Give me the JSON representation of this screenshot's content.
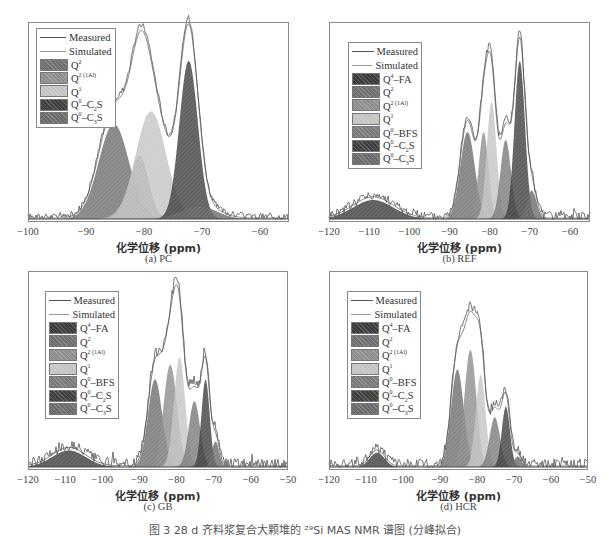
{
  "colors": {
    "measured": "#555555",
    "simulated": "#8a8a8a",
    "frame": "#8a8a8a",
    "Q4-FA": "#3a3a3a",
    "Q2": "#6e6e6e",
    "Q2(1Al)": "#8e8e8e",
    "Q1": "#c4c4c4",
    "Q0-BFS": "#7a7a7a",
    "Q0-C2S": "#3e3e3e",
    "Q0-C3S": "#6a6a6a"
  },
  "caption": "图 3  28 d 齐料浆复合大颗堆的 ²⁹Si MAS NMR 谱图 (分峰拟合)",
  "chart_data": [
    {
      "type": "area",
      "panel_label": "(a)  PC",
      "xlabel": "化学位移 (ppm)",
      "ylabel": "",
      "xlim": [
        -100,
        -55
      ],
      "x_ticks": [
        -100,
        -90,
        -80,
        -70,
        -60
      ],
      "grid": false,
      "legend_position": "upper-left",
      "legend": [
        "Measured",
        "Simulated",
        "Q2",
        "Q2 (1Al)",
        "Q1",
        "Q0-C2S",
        "Q0-C3S"
      ],
      "peaks": [
        {
          "name": "Q2",
          "center": -85.2,
          "height": 0.6,
          "width": 2.6
        },
        {
          "name": "Q2(1Al)",
          "center": -80.8,
          "height": 0.4,
          "width": 1.6
        },
        {
          "name": "Q1",
          "center": -78.8,
          "height": 0.68,
          "width": 2.6
        },
        {
          "name": "Q0-C2S",
          "center": -72.3,
          "height": 1.0,
          "width": 1.6
        },
        {
          "name": "Q0-C3S",
          "center": -70.5,
          "height": 0.08,
          "width": 3.0
        }
      ],
      "measured_peak_max": 1.18,
      "ylim": [
        0,
        1.22
      ],
      "noise_floor": 0.02
    },
    {
      "type": "area",
      "panel_label": "(b)  REF",
      "xlabel": "化学位移 (ppm)",
      "ylabel": "",
      "xlim": [
        -120,
        -55
      ],
      "x_ticks": [
        -120,
        -110,
        -100,
        -90,
        -80,
        -70,
        -60
      ],
      "grid": false,
      "legend_position": "upper-left",
      "legend": [
        "Measured",
        "Simulated",
        "Q4-FA",
        "Q2",
        "Q2 (1Al)",
        "Q1",
        "Q0-BFS",
        "Q0-C2S",
        "Q0-C3S"
      ],
      "peaks": [
        {
          "name": "Q4-FA",
          "center": -109,
          "height": 0.12,
          "width": 5.0
        },
        {
          "name": "Q2",
          "center": -85.5,
          "height": 0.55,
          "width": 1.8
        },
        {
          "name": "Q2(1Al)",
          "center": -81.5,
          "height": 0.55,
          "width": 1.2
        },
        {
          "name": "Q1",
          "center": -79.5,
          "height": 0.74,
          "width": 1.2
        },
        {
          "name": "Q0-BFS",
          "center": -76,
          "height": 0.5,
          "width": 1.3
        },
        {
          "name": "Q0-C2S",
          "center": -72.5,
          "height": 1.0,
          "width": 1.3
        },
        {
          "name": "Q0-C3S",
          "center": -69.5,
          "height": 0.18,
          "width": 1.2
        }
      ],
      "ylim": [
        0,
        1.22
      ],
      "noise_floor": 0.03
    },
    {
      "type": "area",
      "panel_label": "(c)  GB",
      "xlabel": "化学位移 (ppm)",
      "ylabel": "",
      "xlim": [
        -120,
        -50
      ],
      "x_ticks": [
        -120,
        -110,
        -100,
        -90,
        -80,
        -70,
        -60,
        -50
      ],
      "grid": false,
      "legend_position": "upper-left",
      "legend": [
        "Measured",
        "Simulated",
        "Q4-FA",
        "Q2",
        "Q2 (1Al)",
        "Q1",
        "Q0-BFS",
        "Q0-C2S",
        "Q0-C3S"
      ],
      "peaks": [
        {
          "name": "Q4-FA",
          "center": -109,
          "height": 0.09,
          "width": 4.5
        },
        {
          "name": "Q2",
          "center": -85.8,
          "height": 0.48,
          "width": 1.9
        },
        {
          "name": "Q2(1Al)",
          "center": -81.7,
          "height": 0.56,
          "width": 1.8
        },
        {
          "name": "Q1",
          "center": -79.2,
          "height": 0.6,
          "width": 1.5
        },
        {
          "name": "Q0-BFS",
          "center": -75.2,
          "height": 0.36,
          "width": 1.5
        },
        {
          "name": "Q0-C2S",
          "center": -72.2,
          "height": 0.48,
          "width": 1.1
        },
        {
          "name": "Q0-C3S",
          "center": -69.5,
          "height": 0.14,
          "width": 1.0
        }
      ],
      "ylim": [
        0,
        1.05
      ],
      "noise_floor": 0.03
    },
    {
      "type": "area",
      "panel_label": "(d)  HCR",
      "xlabel": "化学位移 (ppm)",
      "ylabel": "",
      "xlim": [
        -120,
        -50
      ],
      "x_ticks": [
        -120,
        -110,
        -100,
        -90,
        -80,
        -70,
        -60,
        -50
      ],
      "grid": false,
      "legend_position": "upper-left",
      "legend": [
        "Measured",
        "Simulated",
        "Q4-FA",
        "Q2",
        "Q2 (1Al)",
        "Q1",
        "Q0-BFS",
        "Q0-C2S",
        "Q0-C3S"
      ],
      "peaks": [
        {
          "name": "Q4-FA",
          "center": -107,
          "height": 0.08,
          "width": 2.0
        },
        {
          "name": "Q2",
          "center": -85.3,
          "height": 0.55,
          "width": 1.7
        },
        {
          "name": "Q2(1Al)",
          "center": -81.8,
          "height": 0.66,
          "width": 1.6
        },
        {
          "name": "Q1",
          "center": -79.0,
          "height": 0.52,
          "width": 1.3
        },
        {
          "name": "Q0-BFS",
          "center": -75.2,
          "height": 0.28,
          "width": 1.4
        },
        {
          "name": "Q0-C2S",
          "center": -72.2,
          "height": 0.34,
          "width": 1.1
        },
        {
          "name": "Q0-C3S",
          "center": -69.0,
          "height": 0.06,
          "width": 1.0
        }
      ],
      "ylim": [
        0,
        1.08
      ],
      "noise_floor": 0.03
    }
  ],
  "panels": [
    {
      "box": [
        28,
        22,
        261,
        200
      ],
      "legend_box": [
        36,
        28,
        72,
        100
      ]
    },
    {
      "box": [
        329,
        22,
        261,
        200
      ],
      "legend_box": [
        348,
        42,
        66,
        127
      ]
    },
    {
      "box": [
        28,
        271,
        260,
        199
      ],
      "legend_box": [
        45,
        291,
        66,
        128
      ]
    },
    {
      "box": [
        329,
        271,
        259,
        199
      ],
      "legend_box": [
        347,
        291,
        66,
        128
      ]
    }
  ],
  "legend_labels": {
    "Measured": "Measured",
    "Simulated": "Simulated",
    "Q4-FA": [
      "Q",
      "4",
      "–FA"
    ],
    "Q2": [
      "Q",
      "2",
      ""
    ],
    "Q2(1Al)": [
      "Q",
      "2 (1Al)",
      ""
    ],
    "Q1": [
      "Q",
      "1",
      ""
    ],
    "Q0-BFS": [
      "Q",
      "0",
      "–BFS"
    ],
    "Q0-C2S": [
      "Q",
      "0",
      "–C",
      "2",
      "S"
    ],
    "Q0-C3S": [
      "Q",
      "0",
      "–C",
      "3",
      "S"
    ]
  }
}
